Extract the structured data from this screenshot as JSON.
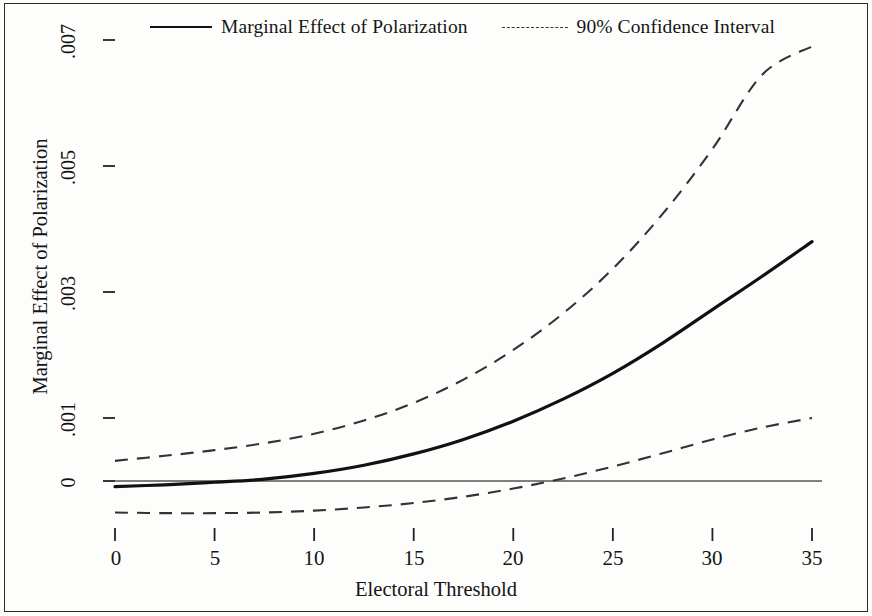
{
  "figure": {
    "background_color": "#fdfdfc",
    "border_color": "#2b2b2b",
    "line_color": "#111111",
    "ci_color": "#333333",
    "zero_line_color": "#555555"
  },
  "legend": {
    "entries": [
      {
        "label": "Marginal Effect of Polarization",
        "style": "solid"
      },
      {
        "label": "90% Confidence Interval",
        "style": "dashed"
      }
    ]
  },
  "axes": {
    "x_title": "Electoral Threshold",
    "y_title": "Marginal Effect of Polarization",
    "x_ticks": [
      "0",
      "5",
      "10",
      "15",
      "20",
      "25",
      "30",
      "35"
    ],
    "y_ticks": [
      "0",
      ".001",
      ".003",
      ".005",
      ".007"
    ]
  },
  "chart_data": {
    "type": "line",
    "title": "",
    "xlabel": "Electoral Threshold",
    "ylabel": "Marginal Effect of Polarization",
    "xlim": [
      0,
      35
    ],
    "ylim": [
      -0.0007,
      0.007
    ],
    "grid": false,
    "legend_position": "top-center",
    "x_ticks": [
      0,
      5,
      10,
      15,
      20,
      25,
      30,
      35
    ],
    "y_ticks": [
      0,
      0.001,
      0.003,
      0.005,
      0.007
    ],
    "x": [
      0,
      2.5,
      5,
      7.5,
      10,
      12.5,
      15,
      17.5,
      20,
      22.5,
      25,
      27.5,
      30,
      32.5,
      35
    ],
    "series": [
      {
        "name": "Marginal Effect of Polarization",
        "style": "solid",
        "values": [
          -9e-05,
          -6e-05,
          -2e-05,
          3e-05,
          0.00012,
          0.00025,
          0.00043,
          0.00066,
          0.00095,
          0.0013,
          0.00171,
          0.00219,
          0.00272,
          0.00325,
          0.0038
        ]
      },
      {
        "name": "90% Confidence Interval (upper)",
        "style": "dashed",
        "values": [
          0.00032,
          0.0004,
          0.00049,
          0.0006,
          0.00075,
          0.00096,
          0.00124,
          0.00161,
          0.00208,
          0.00266,
          0.00337,
          0.00424,
          0.00527,
          0.00645,
          0.0069
        ]
      },
      {
        "name": "90% Confidence Interval (lower)",
        "style": "dashed",
        "values": [
          -0.0005,
          -0.00051,
          -0.00051,
          -0.0005,
          -0.00047,
          -0.00042,
          -0.00035,
          -0.00025,
          -0.00012,
          4e-05,
          0.00023,
          0.00044,
          0.00066,
          0.00085,
          0.001
        ]
      }
    ],
    "annotations": [
      {
        "text": "zero reference line",
        "y": 0
      }
    ]
  }
}
